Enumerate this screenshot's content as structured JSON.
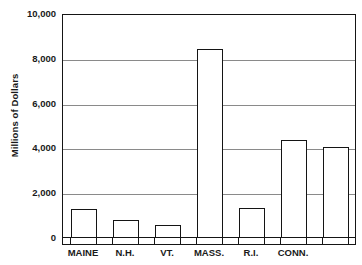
{
  "chart_data": {
    "type": "bar",
    "title": "",
    "subtitle": "",
    "xlabel": "",
    "ylabel": "Millions of Dollars",
    "categories": [
      "MAINE",
      "N.H.",
      "VT.",
      "MASS.",
      "R.I.",
      "CONN.",
      ""
    ],
    "values": [
      1250,
      750,
      520,
      8380,
      1280,
      4350,
      4020
    ],
    "ylim": [
      0,
      10000
    ],
    "yticks": [
      0,
      2000,
      4000,
      6000,
      8000,
      10000
    ],
    "ytick_labels": [
      "0",
      "2,000",
      "4,000",
      "6,000",
      "8,000",
      "10,000"
    ],
    "grid": true,
    "grid_axis": "y",
    "legend": false,
    "bar_fill": "#ffffff",
    "bar_edge": "#141414",
    "grid_color": "#8a8a8a",
    "axis_color": "#151515",
    "text_color": "#1a1a1a"
  }
}
